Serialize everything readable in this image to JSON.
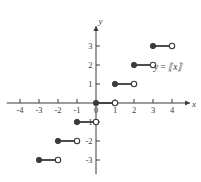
{
  "figure": {
    "name": "greatest-integer-function-graph",
    "background": "#ffffff",
    "ink_color": "#3a3a3a",
    "width": 201,
    "height": 182
  },
  "labels": {
    "x_axis_name": "x",
    "y_axis_name": "y",
    "origin_label": "0",
    "function_label_prefix": "y",
    "function_label_equals": "=",
    "function_label_expression": "⟦x⟧",
    "function_label_full": "y = ⟦x⟧"
  },
  "chart_data": {
    "type": "line",
    "title": "",
    "subtitle": "",
    "xlabel": "x",
    "ylabel": "y",
    "function_label": "y = ⟦x⟧",
    "grid": false,
    "legend": "none",
    "xlim": [
      -4.6,
      4.9
    ],
    "ylim": [
      -3.6,
      3.9
    ],
    "xticks": [
      -4,
      -3,
      -2,
      -1,
      0,
      1,
      2,
      3,
      4
    ],
    "xtick_labels": [
      "-4",
      "-3",
      "-2",
      "-1",
      "0",
      "1",
      "2",
      "3",
      "4"
    ],
    "yticks": [
      3,
      2,
      1,
      -1,
      -2,
      -3
    ],
    "ytick_labels": [
      "3",
      "2",
      "1",
      "-1",
      "-2",
      "-3"
    ],
    "series": [
      {
        "name": "floor(x)",
        "style": "step-segments",
        "segments": [
          {
            "x_start": -3.0,
            "x_end": -2.0,
            "y": -3,
            "left_endpoint": "closed",
            "right_endpoint": "open",
            "visible": true
          },
          {
            "x_start": -2.0,
            "x_end": -1.0,
            "y": -2,
            "left_endpoint": "closed",
            "right_endpoint": "open",
            "visible": true
          },
          {
            "x_start": -1.0,
            "x_end": 0.0,
            "y": -1,
            "left_endpoint": "closed",
            "right_endpoint": "open",
            "visible": true
          },
          {
            "x_start": 0.0,
            "x_end": 1.0,
            "y": 0,
            "left_endpoint": "closed",
            "right_endpoint": "open",
            "visible": true
          },
          {
            "x_start": 1.0,
            "x_end": 2.0,
            "y": 1,
            "left_endpoint": "closed",
            "right_endpoint": "open",
            "visible": true
          },
          {
            "x_start": 2.0,
            "x_end": 3.0,
            "y": 2,
            "left_endpoint": "closed",
            "right_endpoint": "open",
            "visible": true
          },
          {
            "x_start": 3.0,
            "x_end": 4.0,
            "y": 3,
            "left_endpoint": "closed",
            "right_endpoint": "open",
            "visible": true
          }
        ]
      }
    ],
    "annotations": [
      {
        "text": "y = ⟦x⟧",
        "x": 3.05,
        "y": 1.72,
        "anchor": "start"
      }
    ]
  },
  "axes": {
    "origin_px": {
      "x": 96,
      "y": 103
    },
    "unit_px": 19.0,
    "x_axis_from": -4.7,
    "x_axis_to": 4.95,
    "y_axis_from": -3.75,
    "y_axis_to": 4.05,
    "tick_len_px": 4,
    "arrow_x": true,
    "arrow_y": true
  }
}
